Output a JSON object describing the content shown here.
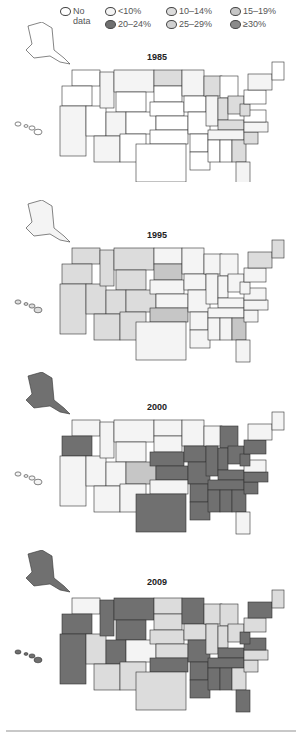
{
  "legend": {
    "items": [
      {
        "label": "No data",
        "line1": "No",
        "line2": "data",
        "color": "#ffffff"
      },
      {
        "label": "<10%",
        "color": "#f4f4f4"
      },
      {
        "label": "10–14%",
        "color": "#dcdcdc"
      },
      {
        "label": "15–19%",
        "color": "#c6c6c6"
      },
      {
        "label": "20–24%",
        "color": "#707070"
      },
      {
        "label": "25–29%",
        "color": "#d0d0d0"
      },
      {
        "label": "≥30%",
        "color": "#8a8a8a"
      }
    ]
  },
  "maps": [
    {
      "year": "1985"
    },
    {
      "year": "1995"
    },
    {
      "year": "2000"
    },
    {
      "year": "2009"
    }
  ],
  "chart_data": {
    "type": "choropleth",
    "legend_categories": [
      "No data",
      "<10%",
      "10–14%",
      "15–19%",
      "20–24%",
      "25–29%",
      "≥30%"
    ],
    "panels": [
      {
        "year": "1985",
        "states": {
          "WA": "No data",
          "OR": "No data",
          "CA": "<10%",
          "NV": "No data",
          "ID": "<10%",
          "MT": "<10%",
          "WY": "No data",
          "UT": "<10%",
          "CO": "No data",
          "AZ": "<10%",
          "NM": "No data",
          "ND": "10–14%",
          "SD": "No data",
          "NE": "No data",
          "KS": "No data",
          "OK": "No data",
          "TX": "No data",
          "MN": "<10%",
          "IA": "No data",
          "MO": "No data",
          "AR": "No data",
          "LA": "No data",
          "WI": "10–14%",
          "IL": "<10%",
          "MI": "No data",
          "IN": "10–14%",
          "OH": "10–14%",
          "KY": "10–14%",
          "TN": "<10%",
          "MS": "No data",
          "AL": "No data",
          "GA": "10–14%",
          "FL": "<10%",
          "SC": "10–14%",
          "NC": "<10%",
          "VA": "No data",
          "WV": "10–14%",
          "PA": "No data",
          "NY": "<10%",
          "ME": "No data",
          "AK": "No data",
          "HI": "No data"
        }
      },
      {
        "year": "1995",
        "states": {
          "WA": "10–14%",
          "OR": "10–14%",
          "CA": "10–14%",
          "NV": "10–14%",
          "ID": "10–14%",
          "MT": "10–14%",
          "WY": "10–14%",
          "UT": "10–14%",
          "CO": "10–14%",
          "AZ": "10–14%",
          "NM": "10–14%",
          "ND": "<10%",
          "SD": "15–19%",
          "NE": "<10%",
          "KS": "<10%",
          "OK": "15–19%",
          "TX": "<10%",
          "MN": "<10%",
          "IA": "<10%",
          "MO": "<10%",
          "AR": "<10%",
          "LA": "<10%",
          "WI": "<10%",
          "IL": "<10%",
          "MI": "<10%",
          "IN": "<10%",
          "OH": "<10%",
          "KY": "<10%",
          "TN": "<10%",
          "MS": "<10%",
          "AL": "<10%",
          "GA": "15–19%",
          "FL": "<10%",
          "SC": "<10%",
          "NC": "<10%",
          "VA": "<10%",
          "WV": "<10%",
          "PA": "<10%",
          "NY": "10–14%",
          "ME": "10–14%",
          "AK": "<10%",
          "HI": "10–14%"
        }
      },
      {
        "year": "2000",
        "states": {
          "WA": "<10%",
          "OR": "20–24%",
          "CA": "<10%",
          "NV": "<10%",
          "ID": "<10%",
          "MT": "<10%",
          "WY": "<10%",
          "UT": "<10%",
          "CO": "15–19%",
          "AZ": "<10%",
          "NM": "<10%",
          "ND": "<10%",
          "SD": "<10%",
          "NE": "20–24%",
          "KS": "20–24%",
          "OK": "<10%",
          "TX": "20–24%",
          "MN": "<10%",
          "IA": "20–24%",
          "MO": "20–24%",
          "AR": "20–24%",
          "LA": "20–24%",
          "WI": "<10%",
          "IL": "20–24%",
          "MI": "20–24%",
          "IN": "20–24%",
          "OH": "20–24%",
          "KY": "20–24%",
          "TN": "20–24%",
          "MS": "20–24%",
          "AL": "20–24%",
          "GA": "20–24%",
          "FL": "<10%",
          "SC": "20–24%",
          "NC": "20–24%",
          "VA": "<10%",
          "WV": "20–24%",
          "PA": "20–24%",
          "NY": "<10%",
          "ME": "<10%",
          "AK": "20–24%",
          "HI": "<10%"
        }
      },
      {
        "year": "2009",
        "states": {
          "WA": "<10%",
          "OR": "20–24%",
          "CA": "20–24%",
          "NV": "10–14%",
          "ID": "20–24%",
          "MT": "20–24%",
          "WY": "20–24%",
          "UT": "20–24%",
          "CO": "<10%",
          "AZ": "10–14%",
          "NM": "10–14%",
          "ND": "10–14%",
          "SD": "10–14%",
          "NE": "10–14%",
          "KS": "10–14%",
          "OK": "20–24%",
          "TX": "10–14%",
          "MN": "20–24%",
          "IA": "10–14%",
          "MO": "20–24%",
          "AR": "20–24%",
          "LA": "20–24%",
          "WI": "10–14%",
          "IL": "10–14%",
          "MI": "10–14%",
          "IN": "10–14%",
          "OH": "10–14%",
          "KY": "20–24%",
          "TN": "20–24%",
          "MS": "20–24%",
          "AL": "20–24%",
          "GA": "10–14%",
          "FL": "20–24%",
          "SC": "10–14%",
          "NC": "10–14%",
          "VA": "20–24%",
          "WV": "20–24%",
          "PA": "10–14%",
          "NY": "20–24%",
          "ME": "10–14%",
          "AK": "20–24%",
          "HI": "20–24%"
        }
      }
    ]
  }
}
